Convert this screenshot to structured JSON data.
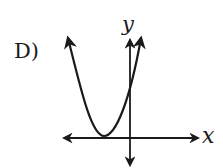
{
  "option": {
    "label": "D)"
  },
  "axes": {
    "x_label": "x",
    "y_label": "y"
  },
  "graph": {
    "type": "parabola",
    "opens": "up",
    "vertex_position": "left of y-axis, on x-axis",
    "y_intercept": "positive"
  },
  "colors": {
    "ink": "#1a1a1a",
    "background": "#ffffff"
  }
}
